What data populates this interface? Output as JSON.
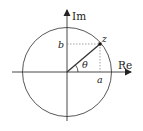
{
  "diagram": {
    "axes": {
      "x_label": "Re",
      "y_label": "Im"
    },
    "point": {
      "label": "z",
      "real_part_label": "a",
      "imag_part_label": "b",
      "angle_label": "θ"
    },
    "colors": {
      "stroke": "#333333",
      "dotted": "#888888",
      "background": "#ffffff"
    }
  }
}
